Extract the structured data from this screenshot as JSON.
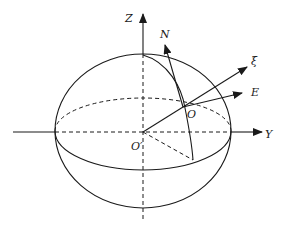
{
  "diagram": {
    "type": "geodetic-ellipsoid-coordinate-frame",
    "labels": {
      "z_axis": "Z",
      "y_axis": "Y",
      "north": "N",
      "xi": "ξ",
      "east": "E",
      "origin_local": "O",
      "origin_center": "O′"
    },
    "colors": {
      "stroke": "#1a1a1a",
      "background": "#ffffff"
    }
  }
}
